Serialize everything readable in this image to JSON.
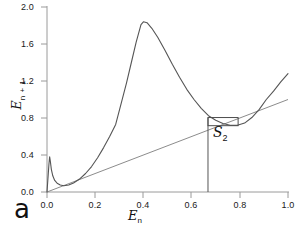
{
  "figure": {
    "panel_label": "a",
    "background_color": "#ffffff"
  },
  "annotations": {
    "box_label": "S",
    "box_label_sub": "2",
    "axis_label_x_main": "E",
    "axis_label_x_sub": "n",
    "axis_label_y_main": "E",
    "axis_label_y_sub": "n + 1"
  },
  "colors": {
    "curve": "#555555",
    "diagonal": "#8c8c8c",
    "axis": "#9a9a9a",
    "text": "#111111",
    "box": "#4d4d4d"
  },
  "chart_data": {
    "type": "line",
    "title": "",
    "subtitle": "",
    "xlabel": "E_n",
    "ylabel": "E_n+1",
    "xlim": [
      0.0,
      1.0
    ],
    "ylim": [
      0.0,
      2.0
    ],
    "grid": false,
    "legend": "none",
    "xticks": [
      0.0,
      0.2,
      0.4,
      0.6,
      0.8,
      1.0
    ],
    "xtick_labels": [
      "0.0",
      "0.2",
      "0.4",
      "0.6",
      "0.8",
      "1.0"
    ],
    "yticks": [
      0.0,
      0.4,
      0.8,
      1.2,
      1.6,
      2.0
    ],
    "ytick_labels": [
      "0.0",
      "0.4",
      "0.8",
      "1.2",
      "1.6",
      "2.0"
    ],
    "series": [
      {
        "name": "return-map",
        "kind": "curve",
        "color": "#555555",
        "points": [
          [
            0.0,
            0.0
          ],
          [
            0.004,
            0.15
          ],
          [
            0.008,
            0.3
          ],
          [
            0.011,
            0.38
          ],
          [
            0.014,
            0.33
          ],
          [
            0.018,
            0.245
          ],
          [
            0.024,
            0.175
          ],
          [
            0.032,
            0.125
          ],
          [
            0.042,
            0.095
          ],
          [
            0.055,
            0.075
          ],
          [
            0.07,
            0.068
          ],
          [
            0.09,
            0.075
          ],
          [
            0.11,
            0.098
          ],
          [
            0.135,
            0.14
          ],
          [
            0.16,
            0.2
          ],
          [
            0.185,
            0.275
          ],
          [
            0.21,
            0.37
          ],
          [
            0.235,
            0.48
          ],
          [
            0.26,
            0.6
          ],
          [
            0.285,
            0.73
          ],
          [
            0.31,
            0.98
          ],
          [
            0.33,
            1.18
          ],
          [
            0.35,
            1.4
          ],
          [
            0.37,
            1.62
          ],
          [
            0.39,
            1.81
          ],
          [
            0.4,
            1.84
          ],
          [
            0.415,
            1.83
          ],
          [
            0.435,
            1.77
          ],
          [
            0.46,
            1.67
          ],
          [
            0.49,
            1.53
          ],
          [
            0.52,
            1.38
          ],
          [
            0.55,
            1.24
          ],
          [
            0.58,
            1.11
          ],
          [
            0.61,
            1.0
          ],
          [
            0.64,
            0.905
          ],
          [
            0.67,
            0.825
          ],
          [
            0.7,
            0.775
          ],
          [
            0.73,
            0.74
          ],
          [
            0.76,
            0.722
          ],
          [
            0.79,
            0.722
          ],
          [
            0.82,
            0.745
          ],
          [
            0.85,
            0.805
          ],
          [
            0.88,
            0.89
          ],
          [
            0.91,
            1.0
          ],
          [
            0.94,
            1.09
          ],
          [
            0.97,
            1.19
          ],
          [
            1.0,
            1.28
          ]
        ]
      },
      {
        "name": "identity-line",
        "kind": "line",
        "color": "#8c8c8c",
        "points": [
          [
            0.0,
            0.0
          ],
          [
            1.0,
            1.0
          ]
        ]
      }
    ],
    "markers": [
      {
        "name": "vertical-drop-line",
        "type": "vline",
        "x": 0.668,
        "y0": 0.0,
        "y1": 0.805,
        "color": "#555555"
      },
      {
        "name": "s2-box",
        "type": "rect",
        "x0": 0.668,
        "x1": 0.793,
        "y0": 0.717,
        "y1": 0.805,
        "color": "#4d4d4d"
      }
    ]
  }
}
